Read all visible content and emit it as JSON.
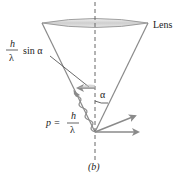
{
  "diagram": {
    "panel_label": "(b)",
    "lens_label": "Lens",
    "uncertainty_label": {
      "numerator": "h",
      "denominator": "λ",
      "suffix": "sin α"
    },
    "momentum_label": {
      "prefix": "p =",
      "numerator": "h",
      "denominator": "λ"
    },
    "angle_label": "α",
    "colors": {
      "line": "#8a8a8a",
      "arrow": "#8a8a8a",
      "text": "#222222",
      "lens_fill": "#d6d6d6",
      "axis": "#666666"
    }
  }
}
